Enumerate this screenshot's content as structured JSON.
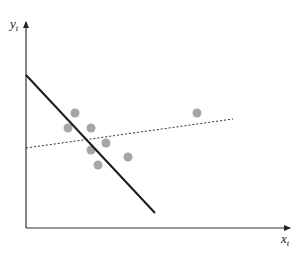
{
  "diagram": {
    "y_label": "y",
    "y_sub": "t",
    "x_label": "x",
    "x_sub": "t",
    "points": [
      {
        "x": 75,
        "y": 113
      },
      {
        "x": 68,
        "y": 128
      },
      {
        "x": 91,
        "y": 128
      },
      {
        "x": 106,
        "y": 143
      },
      {
        "x": 91,
        "y": 150
      },
      {
        "x": 128,
        "y": 157
      },
      {
        "x": 98,
        "y": 165
      },
      {
        "x": 197,
        "y": 113
      }
    ],
    "solid_line": {
      "x1": 26,
      "y1": 75,
      "x2": 155,
      "y2": 213
    },
    "dotted_line": {
      "x1": 26,
      "y1": 148,
      "x2": 233,
      "y2": 119
    },
    "point_color": "#a6a6a6",
    "line_color": "#1a1a1a"
  }
}
